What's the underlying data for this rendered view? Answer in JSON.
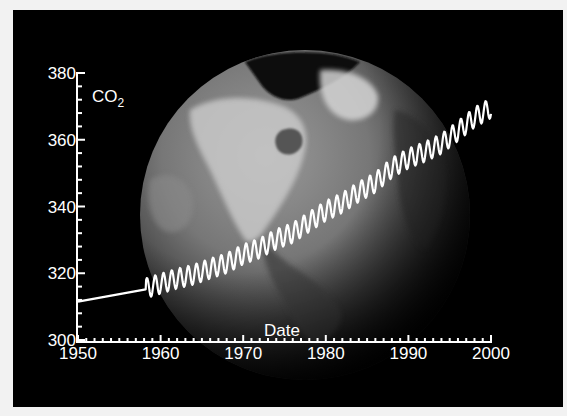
{
  "chart_data": {
    "type": "line",
    "title": "",
    "xlabel": "Date",
    "ylabel": "CO2",
    "ylabel_subscript": "2",
    "ylabel_base": "CO",
    "xlim": [
      1950,
      2000
    ],
    "ylim": [
      300,
      380
    ],
    "x_ticks": [
      1950,
      1960,
      1970,
      1980,
      1990,
      2000
    ],
    "y_ticks": [
      300,
      320,
      340,
      360,
      380
    ],
    "x_minor_step": 1,
    "y_minor_step": 4,
    "grid": false,
    "background": "Earth globe image (grayscale) on black",
    "series": [
      {
        "name": "CO2 (ppm)",
        "description": "Smooth estimate 1950-1958, then monthly Mauna Loa record with seasonal cycle",
        "pre_instrumental": {
          "x": [
            1950,
            1958.2
          ],
          "y": [
            311.5,
            315.2
          ]
        },
        "annual_mean": {
          "x": [
            1958,
            1960,
            1962,
            1964,
            1966,
            1968,
            1970,
            1972,
            1974,
            1976,
            1978,
            1980,
            1982,
            1984,
            1986,
            1988,
            1990,
            1992,
            1994,
            1996,
            1998,
            2000
          ],
          "y": [
            315.3,
            316.9,
            318.4,
            319.6,
            321.4,
            323.0,
            325.7,
            327.5,
            330.2,
            332.1,
            335.4,
            338.7,
            341.1,
            344.4,
            347.2,
            351.6,
            354.4,
            356.4,
            358.8,
            362.6,
            366.7,
            369.5
          ]
        },
        "seasonal_amplitude": 3.0,
        "color": "#ffffff"
      }
    ]
  },
  "colors": {
    "background": "#000000",
    "frame": "#f2f2f2",
    "axis": "#ffffff",
    "line": "#ffffff"
  }
}
